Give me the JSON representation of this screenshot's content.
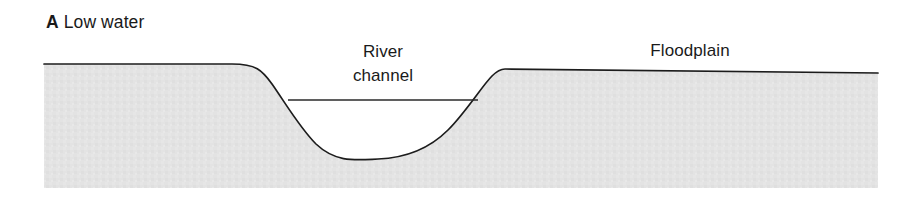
{
  "figure": {
    "panel_letter": "A",
    "panel_caption": " Low water",
    "labels": {
      "river_channel_line1": "River",
      "river_channel_line2": "channel",
      "floodplain": "Floodplain"
    },
    "colors": {
      "ground_fill": "#e3e3e3",
      "outline": "#1c1c1c",
      "water_surface_line": "#2a2a2a",
      "background": "#ffffff",
      "text": "#1a1a1a"
    },
    "geometry": {
      "ground_left_x": 44,
      "ground_right_x": 878,
      "ground_bottom_y": 188,
      "floodplain_left_surface_y": 64,
      "floodplain_right_surface_y": 70,
      "floodplain_right_end_y": 73,
      "water_surface_y": 100,
      "water_surface_left_x": 288,
      "water_surface_right_x": 478,
      "channel_thalweg_x": 378,
      "channel_bottom_y": 159,
      "left_bank_start_x": 232,
      "right_bank_top_x": 505
    }
  }
}
